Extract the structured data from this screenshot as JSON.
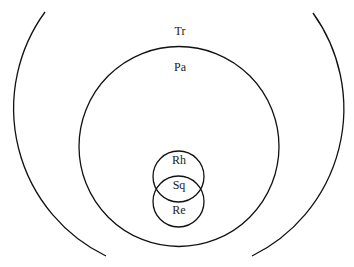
{
  "diagram": {
    "type": "nested-venn",
    "stroke_color": "#111111",
    "background": "#ffffff",
    "sets": [
      {
        "id": "tr",
        "label": "Tr",
        "shape": "open-arcs",
        "cx": 179.5,
        "cy": 110,
        "r": 164,
        "label_pos": [
          180,
          35
        ]
      },
      {
        "id": "pa",
        "label": "Pa",
        "shape": "circle",
        "cx": 179,
        "cy": 146.5,
        "r": 100,
        "label_pos": [
          180,
          71
        ]
      },
      {
        "id": "rh",
        "label": "Rh",
        "shape": "circle",
        "cx": 178.5,
        "cy": 176.5,
        "r": 25.5,
        "label_pos": [
          179,
          164
        ]
      },
      {
        "id": "re",
        "label": "Re",
        "shape": "circle",
        "cx": 178.5,
        "cy": 201.5,
        "r": 25.5,
        "label_pos": [
          179,
          214
        ]
      }
    ],
    "intersections": [
      {
        "id": "sq",
        "label": "Sq",
        "of": [
          "rh",
          "re"
        ],
        "label_pos": [
          179,
          189
        ]
      }
    ]
  }
}
